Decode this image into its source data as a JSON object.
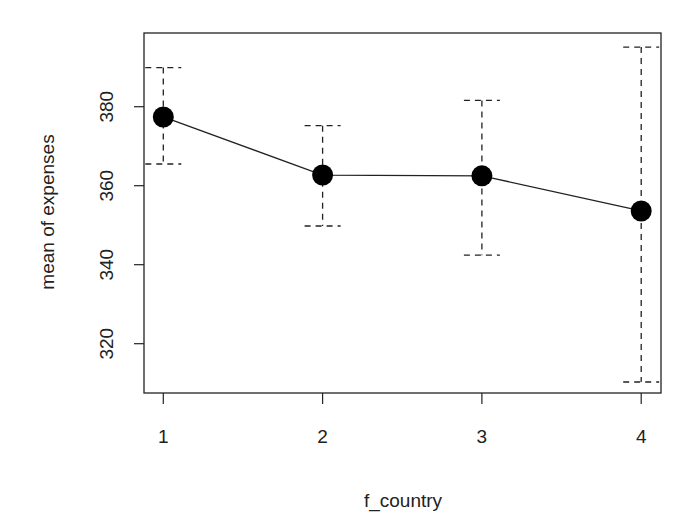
{
  "chart_data": {
    "type": "line",
    "subtype": "means-with-error-bars",
    "title": "",
    "xlabel": "f_country",
    "ylabel": "mean of expenses",
    "categories": [
      "1",
      "2",
      "3",
      "4"
    ],
    "series": [
      {
        "name": "mean of expenses",
        "values": [
          377.4,
          362.7,
          362.5,
          353.6
        ],
        "error_upper": [
          389.9,
          375.2,
          381.6,
          395.1
        ],
        "error_lower": [
          365.5,
          349.8,
          342.4,
          310.3
        ],
        "marker": "filled-circle",
        "line_style": "solid",
        "error_bar_style": "dashed",
        "color": "#000000"
      }
    ],
    "yticks": [
      320,
      340,
      360,
      380
    ],
    "ylim": [
      307,
      399
    ],
    "xlim": [
      0.87,
      4.13
    ],
    "grid": false,
    "legend": null
  },
  "axes": {
    "x_tick_labels": [
      "1",
      "2",
      "3",
      "4"
    ],
    "y_tick_labels": [
      "320",
      "340",
      "360",
      "380"
    ],
    "x_title": "f_country",
    "y_title": "mean of expenses"
  }
}
